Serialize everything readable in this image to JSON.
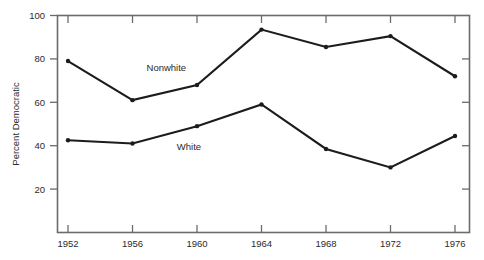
{
  "chart_data": {
    "type": "line",
    "title": "",
    "subtitle": "",
    "xlabel": "",
    "ylabel": "Percent Democratic",
    "x": [
      1952,
      1956,
      1960,
      1964,
      1968,
      1972,
      1976
    ],
    "categories": [
      "1952",
      "1956",
      "1960",
      "1964",
      "1968",
      "1972",
      "1976"
    ],
    "xlim": [
      1950,
      1978
    ],
    "ylim": [
      0,
      100
    ],
    "yticks": [
      20,
      40,
      60,
      80,
      100
    ],
    "ytick_labels": [
      "20",
      "40",
      "60",
      "80",
      "100"
    ],
    "xtick_labels": [
      "1952",
      "1956",
      "1960",
      "1964",
      "1968",
      "1972",
      "1976"
    ],
    "grid": false,
    "legend": "inline-annotations",
    "series": [
      {
        "name": "Nonwhite",
        "label": "Nonwhite",
        "color": "#1c1c1c",
        "values": [
          79,
          61,
          68,
          93.5,
          85.5,
          90.5,
          72
        ]
      },
      {
        "name": "White",
        "label": "White",
        "color": "#1c1c1c",
        "values": [
          42.5,
          41,
          49,
          59,
          38.5,
          30,
          44.5
        ]
      }
    ],
    "annotations": [
      {
        "text": "Nonwhite",
        "x": 1958.1,
        "y": 74.5
      },
      {
        "text": "White",
        "x": 1959.5,
        "y": 38.0
      }
    ]
  }
}
